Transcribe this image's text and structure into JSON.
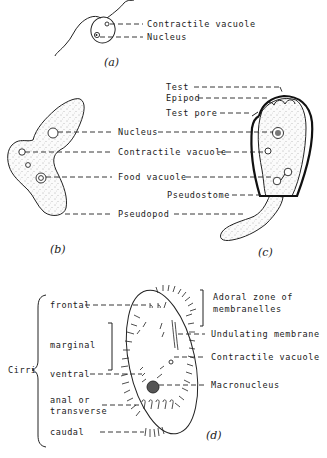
{
  "figure": {
    "panels": [
      {
        "id": "a",
        "caption": "(a)",
        "labels": [
          "Contractile vacuole",
          "Nucleus"
        ]
      },
      {
        "id": "b",
        "caption": "(b)",
        "labels": [
          "Nucleus",
          "Contractile vacuole",
          "Food vacuole",
          "Pseudopod"
        ]
      },
      {
        "id": "c",
        "caption": "(c)",
        "labels": [
          "Test",
          "Epipod",
          "Test pore",
          "Pseudostome"
        ]
      },
      {
        "id": "d",
        "caption": "(d)",
        "group_label": "Cirri",
        "cirri_labels": [
          "frontal",
          "marginal",
          "ventral",
          "anal or",
          "transverse",
          "caudal"
        ],
        "right_labels": [
          "Adoral zone of",
          "membranelles",
          "Undulating membrane",
          "Contractile vacuole",
          "Macronucleus"
        ]
      }
    ]
  }
}
